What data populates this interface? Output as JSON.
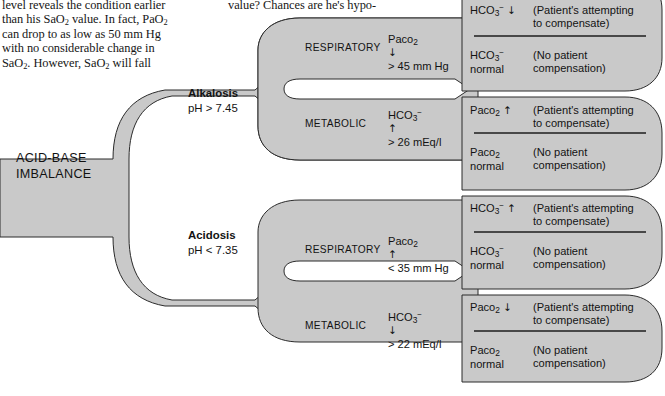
{
  "article": {
    "left_column_lines": [
      "level reveals the condition earlier",
      "than his SaO2 value. In fact, PaO2",
      "can drop to as low as 50 mm Hg",
      "with no considerable change in",
      "SaO2. However, SaO2 will fall"
    ],
    "right_column_lines": [
      "value? Chances are he's hypo-"
    ]
  },
  "diagram": {
    "root_label_line1": "ACID-BASE",
    "root_label_line2": "IMBALANCE",
    "colors": {
      "band_fill": "#c9c9c9",
      "band_stroke": "#2b2b2b",
      "slot_fill": "#ffffff",
      "text": "#131313"
    },
    "branches": [
      {
        "name": "Alkalosis",
        "criterion": "pH > 7.45",
        "subbranches": [
          {
            "type": "RESPIRATORY",
            "measure_line1": "Paco2 ↓",
            "measure_line2": "> 45 mm Hg",
            "outcomes": [
              {
                "value_line1": "HCO3- ↓",
                "value_line2": "",
                "note_line1": "(Patient's attempting",
                "note_line2": "to compensate)"
              },
              {
                "value_line1": "HCO3-",
                "value_line2": "normal",
                "note_line1": "(No patient",
                "note_line2": "compensation)"
              }
            ]
          },
          {
            "type": "METABOLIC",
            "measure_line1": "HCO3- ↑",
            "measure_line2": "> 26 mEq/l",
            "outcomes": [
              {
                "value_line1": "Paco2 ↑",
                "value_line2": "",
                "note_line1": "(Patient's attempting",
                "note_line2": "to compensate)"
              },
              {
                "value_line1": "Paco2",
                "value_line2": "normal",
                "note_line1": "(No patient",
                "note_line2": "compensation)"
              }
            ]
          }
        ]
      },
      {
        "name": "Acidosis",
        "criterion": "pH < 7.35",
        "subbranches": [
          {
            "type": "RESPIRATORY",
            "measure_line1": "Paco2 ↑",
            "measure_line2": "< 35 mm Hg",
            "outcomes": [
              {
                "value_line1": "HCO3- ↑",
                "value_line2": "",
                "note_line1": "(Patient's attempting",
                "note_line2": "to compensate)"
              },
              {
                "value_line1": "HCO3-",
                "value_line2": "normal",
                "note_line1": "(No patient",
                "note_line2": "compensation)"
              }
            ]
          },
          {
            "type": "METABOLIC",
            "measure_line1": "HCO3- ↓",
            "measure_line2": "> 22 mEq/l",
            "outcomes": [
              {
                "value_line1": "Paco2 ↓",
                "value_line2": "",
                "note_line1": "(Patient's attempting",
                "note_line2": "to compensate)"
              },
              {
                "value_line1": "Paco2",
                "value_line2": "normal",
                "note_line1": "(No patient",
                "note_line2": "compensation)"
              }
            ]
          }
        ]
      }
    ]
  }
}
